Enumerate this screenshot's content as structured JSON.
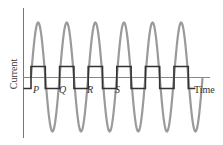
{
  "diagram": {
    "type": "waveform",
    "axes": {
      "y_label": "Current",
      "x_label": "Time"
    },
    "point_labels": [
      "P",
      "Q",
      "R",
      "S"
    ],
    "colors": {
      "sine_wave": "#9a9a9a",
      "square_wave": "#333333",
      "axes": "#777777",
      "text": "#333333"
    },
    "sine_cycles": 6,
    "square_cycles": 6
  }
}
